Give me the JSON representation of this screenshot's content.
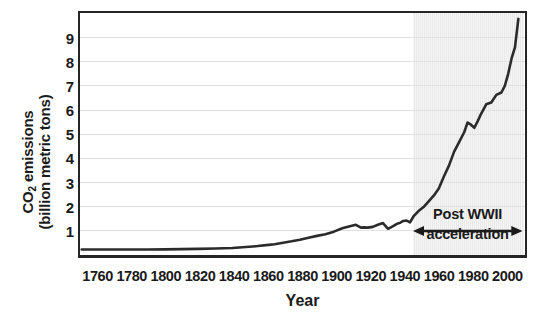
{
  "chart_data": {
    "type": "line",
    "title": "",
    "xlabel": "Year",
    "ylabel_line1": "CO",
    "ylabel_sub": "2",
    "ylabel_line1_rest": " emissions",
    "ylabel_line2": "(billion metric tons)",
    "xlim": [
      1750,
      2010
    ],
    "ylim": [
      0,
      10
    ],
    "grid": true,
    "legend": null,
    "x_ticks": [
      1760,
      1780,
      1800,
      1820,
      1840,
      1860,
      1880,
      1900,
      1920,
      1940,
      1960,
      1980,
      2000
    ],
    "y_ticks": [
      1,
      2,
      3,
      4,
      5,
      6,
      7,
      8,
      9
    ],
    "line_color": "#2b2b2b",
    "shade_color": "#e9e9e9",
    "grid_color": "#e2e2e2",
    "axis_color": "#262626",
    "shade_start_year": 1945,
    "shade_end_year": 2010,
    "annotation": {
      "label_line1": "Post WWII",
      "label_line2": "acceleration",
      "arrow_start_year": 1945,
      "arrow_end_year": 2009,
      "arrow_value": 1.1
    },
    "x": [
      1751,
      1760,
      1770,
      1780,
      1790,
      1800,
      1810,
      1820,
      1830,
      1840,
      1850,
      1855,
      1860,
      1865,
      1870,
      1875,
      1880,
      1885,
      1890,
      1895,
      1900,
      1905,
      1910,
      1913,
      1916,
      1918,
      1920,
      1923,
      1926,
      1929,
      1932,
      1935,
      1937,
      1939,
      1941,
      1943,
      1945,
      1947,
      1950,
      1953,
      1956,
      1959,
      1962,
      1965,
      1968,
      1971,
      1974,
      1977,
      1979,
      1981,
      1983,
      1985,
      1987,
      1990,
      1993,
      1996,
      1999,
      2001,
      2003,
      2005,
      2007,
      2009
    ],
    "y": [
      0.003,
      0.003,
      0.004,
      0.005,
      0.008,
      0.01,
      0.02,
      0.03,
      0.05,
      0.07,
      0.12,
      0.15,
      0.19,
      0.23,
      0.29,
      0.35,
      0.42,
      0.5,
      0.58,
      0.65,
      0.76,
      0.9,
      1.0,
      1.05,
      0.93,
      0.94,
      0.93,
      0.96,
      1.05,
      1.12,
      0.88,
      0.99,
      1.08,
      1.13,
      1.21,
      1.23,
      1.15,
      1.4,
      1.63,
      1.8,
      2.04,
      2.28,
      2.58,
      3.09,
      3.55,
      4.13,
      4.54,
      4.96,
      5.37,
      5.28,
      5.15,
      5.43,
      5.74,
      6.14,
      6.22,
      6.54,
      6.64,
      6.92,
      7.43,
      8.08,
      8.55,
      9.75
    ]
  }
}
